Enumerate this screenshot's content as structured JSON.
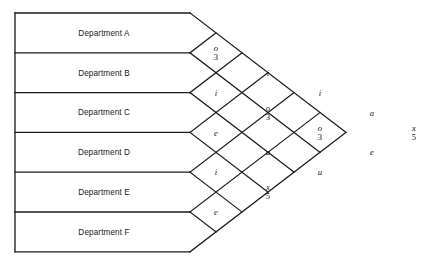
{
  "chart_data": {
    "type": "diagram",
    "departments": [
      "Department A",
      "Department B",
      "Department C",
      "Department D",
      "Department E",
      "Department F"
    ],
    "relationships": [
      {
        "pair": "A-B",
        "code": "o",
        "reason": "3"
      },
      {
        "pair": "B-C",
        "code": "i",
        "reason": ""
      },
      {
        "pair": "C-D",
        "code": "e",
        "reason": ""
      },
      {
        "pair": "D-E",
        "code": "i",
        "reason": ""
      },
      {
        "pair": "E-F",
        "code": "e",
        "reason": ""
      },
      {
        "pair": "A-C",
        "code": "i",
        "reason": ""
      },
      {
        "pair": "B-D",
        "code": "o",
        "reason": "3"
      },
      {
        "pair": "C-E",
        "code": "u",
        "reason": ""
      },
      {
        "pair": "D-F",
        "code": "x",
        "reason": "5"
      },
      {
        "pair": "A-D",
        "code": "i",
        "reason": ""
      },
      {
        "pair": "B-E",
        "code": "o",
        "reason": "3"
      },
      {
        "pair": "C-F",
        "code": "u",
        "reason": ""
      },
      {
        "pair": "A-E",
        "code": "a",
        "reason": ""
      },
      {
        "pair": "B-F",
        "code": "e",
        "reason": ""
      },
      {
        "pair": "A-F",
        "code": "x",
        "reason": "5"
      }
    ],
    "grid": {
      "columns": [
        {
          "index": 1,
          "cells": [
            "o3",
            "i",
            "e",
            "i",
            "e"
          ]
        },
        {
          "index": 2,
          "cells": [
            "i",
            "o3",
            "u",
            "x5"
          ]
        },
        {
          "index": 3,
          "cells": [
            "i",
            "o3",
            "u"
          ]
        },
        {
          "index": 4,
          "cells": [
            "a",
            "e"
          ]
        },
        {
          "index": 5,
          "cells": [
            "x5"
          ]
        }
      ]
    },
    "colors": {
      "line": "#1a1a1a",
      "text": "#111111",
      "background": "#ffffff"
    },
    "geometry": {
      "left_edge_x": 15,
      "top_y": 13,
      "bottom_y": 252,
      "row_height": 39.8,
      "bar_end_x": 190,
      "half_width": 26,
      "half_height": 19.9,
      "apex_x": 434,
      "apex_y": 132.5
    }
  }
}
